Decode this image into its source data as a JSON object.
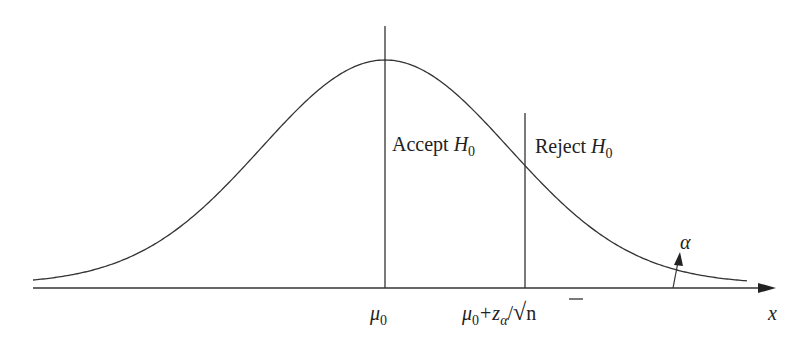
{
  "diagram": {
    "colors": {
      "stroke": "#333333",
      "text": "#222222",
      "background": "#ffffff"
    },
    "labels": {
      "accept": "Accept ",
      "accept_h": "H",
      "accept_sub": "0",
      "reject": "Reject ",
      "reject_h": "H",
      "reject_sub": "0",
      "alpha": "α",
      "mu0_mu": "μ",
      "mu0_sub": "0",
      "crit_mu": "μ",
      "crit_sub": "0",
      "crit_plus": "+",
      "crit_z": "z",
      "crit_zsub": "α",
      "crit_slash": "/",
      "crit_sqrt": "√",
      "crit_n": "n",
      "x_axis": "x"
    },
    "elements": [
      "normal-density-curve",
      "x-axis-arrow",
      "mean-line-mu0",
      "critical-value-line",
      "alpha-arrow"
    ]
  }
}
